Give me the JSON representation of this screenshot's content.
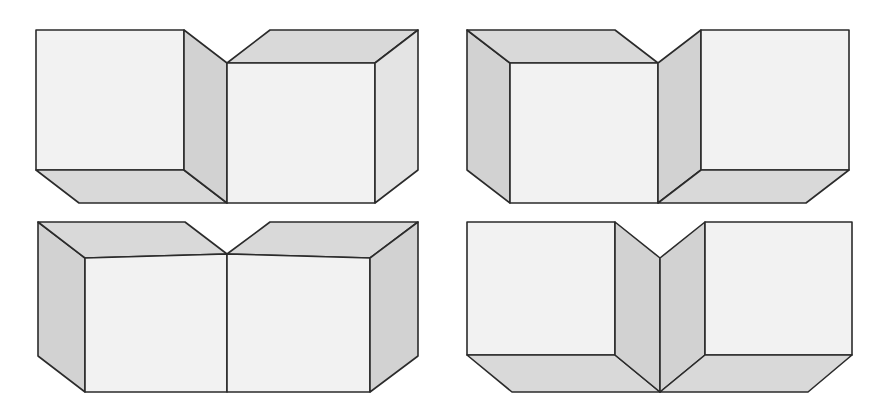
{
  "figure": {
    "background_color": "#ffffff",
    "canvas": {
      "width": 885,
      "height": 413
    },
    "line_color": "#2b2b2b",
    "line_width": 1.6,
    "shading": {
      "front_face": "#f2f2f2",
      "top_face": "#d9d9d9",
      "bottom_face": "#d9d9d9",
      "side_face_light": "#e4e4e4",
      "side_face_dark": "#d2d2d2"
    },
    "panel_count": 4,
    "panels": [
      {
        "name": "top-left",
        "label": "view-a",
        "description": "Two blocks seen from slightly below; left block shows front and right side, right block shows front, top and right side; a V notch at the top centre.",
        "faces": [
          {
            "name": "left-block-front-face",
            "shade": "front_face",
            "points": "36,30 184,30 184,170 36,170"
          },
          {
            "name": "left-block-bottom-face",
            "shade": "bottom_face",
            "points": "36,170 184,170 227,203 79,203"
          },
          {
            "name": "left-block-right-side-face",
            "shade": "side_face_dark",
            "points": "184,30 227,63 227,203 184,170"
          },
          {
            "name": "right-block-top-face",
            "shade": "top_face",
            "points": "227,63 270,30 418,30 375,63"
          },
          {
            "name": "right-block-front-face",
            "shade": "front_face",
            "points": "227,63 375,63 375,203 227,203"
          },
          {
            "name": "right-block-right-side-face",
            "shade": "side_face_light",
            "points": "375,63 418,30 418,170 375,203"
          }
        ]
      },
      {
        "name": "top-right",
        "label": "view-b",
        "description": "Mirror of view-a; left block shows front, top and left side, right block shows front, bottom and right side; a V notch at the top centre.",
        "faces": [
          {
            "name": "left-block-left-side-face",
            "shade": "side_face_dark",
            "points": "467,30 510,63 510,203 467,170"
          },
          {
            "name": "left-block-top-face",
            "shade": "top_face",
            "points": "467,30 615,30 658,63 510,63"
          },
          {
            "name": "left-block-front-face",
            "shade": "front_face",
            "points": "510,63 658,63 658,203 510,203"
          },
          {
            "name": "right-block-left-side-face",
            "shade": "side_face_dark",
            "points": "658,63 701,30 701,170 658,203"
          },
          {
            "name": "right-block-front-face",
            "shade": "front_face",
            "points": "701,30 849,30 849,170 701,170"
          },
          {
            "name": "right-block-bottom-face",
            "shade": "bottom_face",
            "points": "701,170 849,170 806,203 658,203"
          }
        ]
      },
      {
        "name": "bottom-left",
        "label": "view-c",
        "description": "Two blocks seen from above with their front faces coplanar; both top faces slope back to a V notch at the centre; left side face and right side face visible.",
        "faces": [
          {
            "name": "left-block-left-side-face",
            "shade": "side_face_dark",
            "points": "38,222 85,258 85,392 38,356"
          },
          {
            "name": "left-block-top-face",
            "shade": "top_face",
            "points": "38,222 185,222 227,254 85,258"
          },
          {
            "name": "left-block-front-face",
            "shade": "front_face",
            "points": "85,258 227,254 227,392 85,392"
          },
          {
            "name": "right-block-top-face",
            "shade": "top_face",
            "points": "270,222 418,222 370,258 227,254"
          },
          {
            "name": "right-block-front-face",
            "shade": "front_face",
            "points": "227,254 370,258 370,392 227,392"
          },
          {
            "name": "right-block-right-side-face",
            "shade": "side_face_dark",
            "points": "370,258 418,222 418,356 370,392"
          }
        ]
      },
      {
        "name": "bottom-right",
        "label": "view-d",
        "description": "Two blocks seen from below; the two inner side faces form a V meeting at a central vertical edge; bottom faces of both blocks visible splaying out to the lower corners.",
        "faces": [
          {
            "name": "left-block-front-face",
            "shade": "front_face",
            "points": "467,222 615,222 615,355 467,355"
          },
          {
            "name": "left-block-bottom-face",
            "shade": "bottom_face",
            "points": "467,355 615,355 660,392 512,392"
          },
          {
            "name": "left-block-inner-side-face",
            "shade": "side_face_dark",
            "points": "615,222 660,258 660,392 615,355"
          },
          {
            "name": "right-block-inner-side-face",
            "shade": "side_face_dark",
            "points": "660,258 705,222 705,355 660,392"
          },
          {
            "name": "right-block-front-face",
            "shade": "front_face",
            "points": "705,222 852,222 852,355 705,355"
          },
          {
            "name": "right-block-bottom-face",
            "shade": "bottom_face",
            "points": "705,355 852,355 808,392 660,392"
          }
        ]
      }
    ]
  }
}
